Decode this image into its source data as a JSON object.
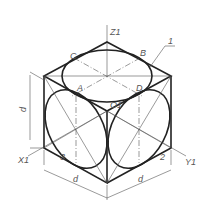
{
  "diagram": {
    "type": "isometric cube with inscribed ellipses",
    "labels": {
      "z_axis": "Z1",
      "x_axis": "X1",
      "y_axis": "Y1",
      "point_a": "A",
      "point_b": "B",
      "point_c": "C",
      "point_d": "D",
      "origin": "O1",
      "leader_1": "1",
      "leader_2": "2",
      "leader_3": "3",
      "dim_vertical": "d",
      "dim_left": "d",
      "dim_right": "d"
    }
  }
}
